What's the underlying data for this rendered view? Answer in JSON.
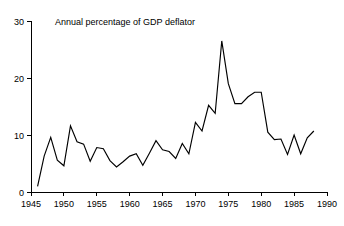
{
  "chart_data": {
    "type": "line",
    "title": "Annual percentage of GDP deflator",
    "xlabel": "",
    "ylabel": "",
    "xlim": [
      1945,
      1990
    ],
    "ylim": [
      0,
      30
    ],
    "grid": false,
    "legend": null,
    "xticks": [
      1945,
      1950,
      1955,
      1960,
      1965,
      1970,
      1975,
      1980,
      1985,
      1990
    ],
    "yticks": [
      0,
      10,
      20,
      30
    ],
    "xtick_labels": [
      "1945",
      "1950",
      "1955",
      "1960",
      "1965",
      "1970",
      "1975",
      "1980",
      "1985",
      "1990"
    ],
    "ytick_labels": [
      "0",
      "10",
      "20",
      "30"
    ],
    "line_color": "#000000",
    "series": [
      {
        "name": "Annual percentage of GDP deflator",
        "x": [
          1946,
          1947,
          1948,
          1949,
          1950,
          1951,
          1952,
          1953,
          1954,
          1955,
          1956,
          1957,
          1958,
          1959,
          1960,
          1961,
          1962,
          1963,
          1964,
          1965,
          1966,
          1967,
          1968,
          1969,
          1970,
          1971,
          1972,
          1973,
          1974,
          1975,
          1976,
          1977,
          1978,
          1979,
          1980,
          1981,
          1982,
          1983,
          1984,
          1985,
          1986,
          1987,
          1988
        ],
        "values": [
          1.0,
          6.3,
          9.6,
          5.6,
          4.6,
          11.6,
          8.8,
          8.4,
          5.4,
          7.8,
          7.6,
          5.5,
          4.4,
          5.3,
          6.3,
          6.7,
          4.7,
          6.8,
          9.0,
          7.4,
          7.1,
          5.9,
          8.5,
          6.7,
          12.2,
          10.7,
          15.2,
          13.8,
          26.5,
          19.0,
          15.5,
          15.5,
          16.7,
          17.5,
          17.5,
          10.5,
          9.2,
          9.3,
          6.6,
          10.0,
          6.7,
          9.5,
          10.7
        ]
      }
    ]
  },
  "axes": {
    "title_position": "top-left-inside"
  }
}
